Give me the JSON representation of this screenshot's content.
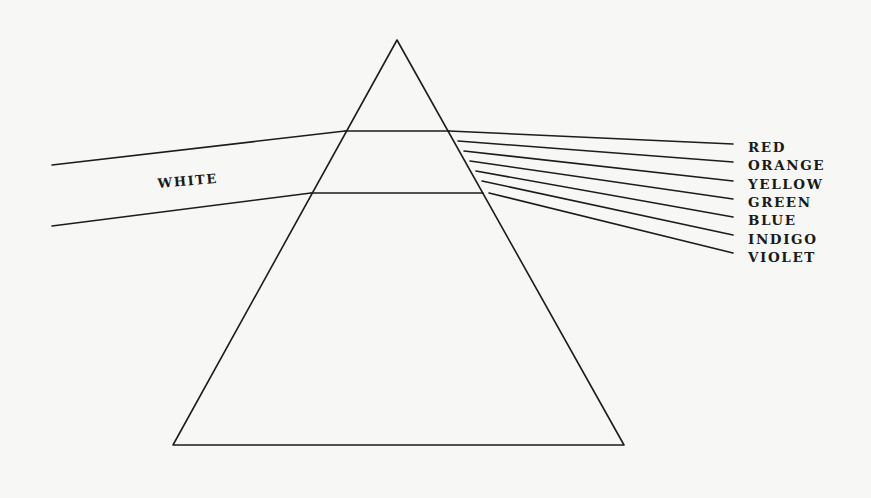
{
  "figure": {
    "colors": {
      "ink": "#1c1c1c",
      "paper": "#f7f7f5"
    },
    "prism": {
      "apex": [
        397,
        40
      ],
      "base_left": [
        173,
        445
      ],
      "base_right": [
        624,
        445
      ]
    },
    "incident_beam": {
      "label": "WHITE",
      "label_position": [
        158,
        188
      ],
      "label_rotation_deg": -5,
      "top_edge": [
        [
          52,
          165
        ],
        [
          345,
          131
        ]
      ],
      "bottom_edge": [
        [
          52,
          226
        ],
        [
          311,
          193
        ]
      ]
    },
    "internal_beam": {
      "top_edge": [
        [
          345,
          131
        ],
        [
          449,
          131
        ]
      ],
      "bottom_edge": [
        [
          311,
          193
        ],
        [
          483,
          193
        ]
      ]
    },
    "spectrum": [
      {
        "label": "RED",
        "start": [
          449,
          131
        ],
        "end": [
          733,
          144
        ],
        "label_y": 152
      },
      {
        "label": "ORANGE",
        "start": [
          458,
          141
        ],
        "end": [
          733,
          162
        ],
        "label_y": 170
      },
      {
        "label": "YELLOW",
        "start": [
          464,
          151
        ],
        "end": [
          733,
          181
        ],
        "label_y": 189
      },
      {
        "label": "GREEN",
        "start": [
          470,
          161
        ],
        "end": [
          733,
          199
        ],
        "label_y": 207
      },
      {
        "label": "BLUE",
        "start": [
          476,
          171
        ],
        "end": [
          733,
          217
        ],
        "label_y": 225
      },
      {
        "label": "INDIGO",
        "start": [
          482,
          181
        ],
        "end": [
          733,
          235
        ],
        "label_y": 244
      },
      {
        "label": "VIOLET",
        "start": [
          489,
          193
        ],
        "end": [
          733,
          253
        ],
        "label_y": 262
      }
    ],
    "label_x": 748
  }
}
